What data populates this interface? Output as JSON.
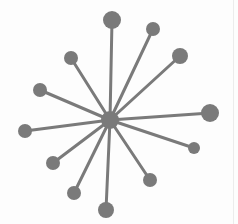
{
  "diagram": {
    "type": "hub-and-spoke",
    "colors": {
      "ink": "#7a7a7a",
      "background": "#fdfdfd"
    },
    "hub": {
      "x": 110,
      "y": 120,
      "r": 9
    },
    "nodes": [
      {
        "x": 112,
        "y": 20,
        "r": 9
      },
      {
        "x": 153,
        "y": 29,
        "r": 7
      },
      {
        "x": 180,
        "y": 56,
        "r": 8
      },
      {
        "x": 71,
        "y": 58,
        "r": 7
      },
      {
        "x": 40,
        "y": 90,
        "r": 7
      },
      {
        "x": 25,
        "y": 131,
        "r": 7
      },
      {
        "x": 210,
        "y": 113,
        "r": 9
      },
      {
        "x": 194,
        "y": 148,
        "r": 6
      },
      {
        "x": 53,
        "y": 163,
        "r": 7
      },
      {
        "x": 74,
        "y": 193,
        "r": 7
      },
      {
        "x": 106,
        "y": 210,
        "r": 8
      },
      {
        "x": 150,
        "y": 180,
        "r": 7
      }
    ]
  }
}
